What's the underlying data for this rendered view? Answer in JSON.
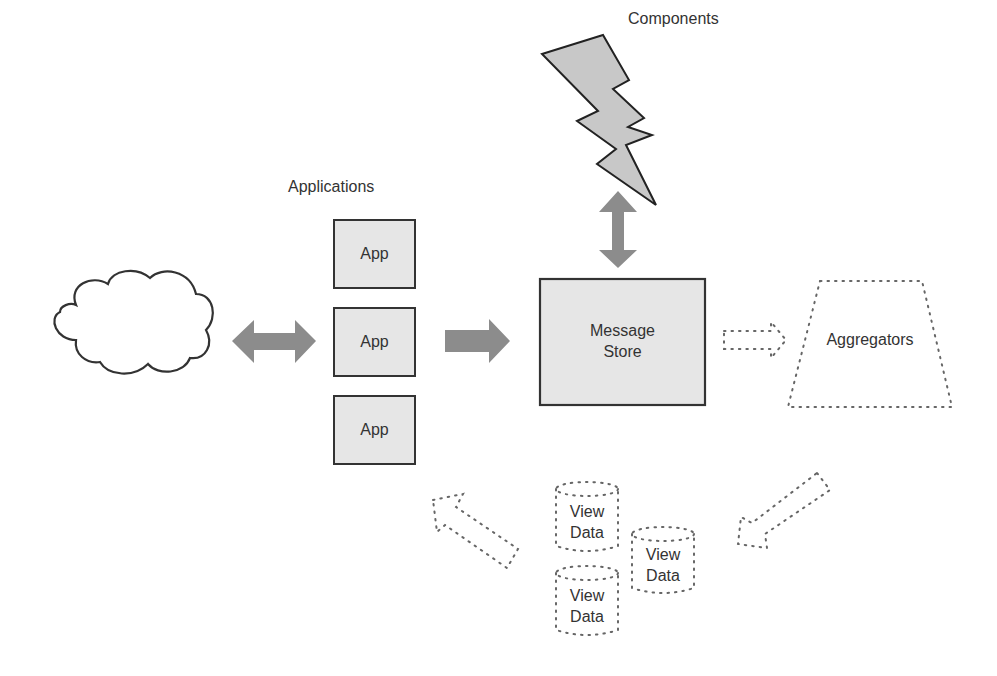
{
  "labels": {
    "components": "Components",
    "applications": "Applications",
    "message_store_line1": "Message",
    "message_store_line2": "Store",
    "aggregators": "Aggregators"
  },
  "apps": [
    {
      "label": "App"
    },
    {
      "label": "App"
    },
    {
      "label": "App"
    }
  ],
  "view_data": [
    {
      "line1": "View",
      "line2": "Data"
    },
    {
      "line1": "View",
      "line2": "Data"
    },
    {
      "line1": "View",
      "line2": "Data"
    }
  ],
  "colors": {
    "box_fill": "#e6e6e6",
    "arrow_fill": "#8c8c8c",
    "stroke": "#333333",
    "dotted": "#666666"
  }
}
